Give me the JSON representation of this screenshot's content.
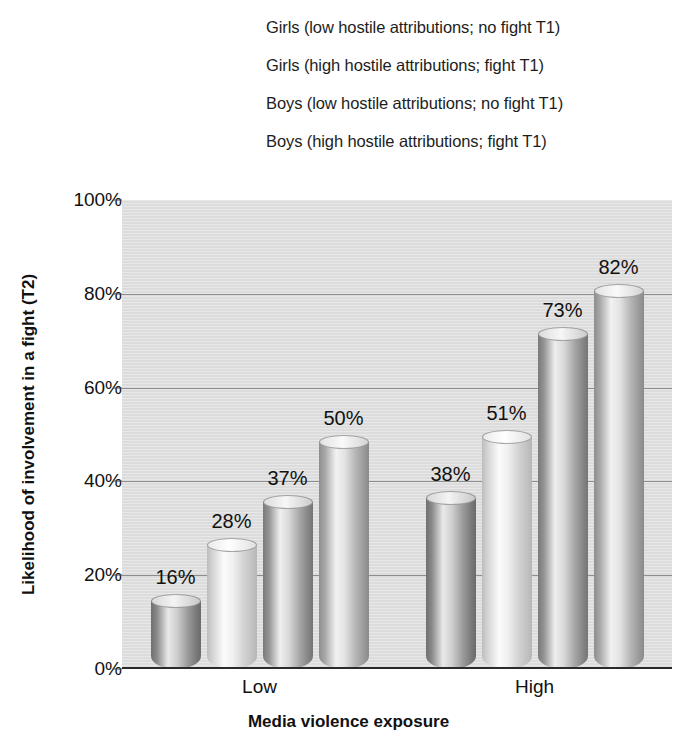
{
  "legend": {
    "position": "top",
    "items": [
      {
        "label": "Girls (low hostile attributions; no fight T1)",
        "shade": "shade-a",
        "swatch_icon": "cylinder-swatch-dark"
      },
      {
        "label": "Girls (high hostile attributions; fight T1)",
        "shade": "shade-b",
        "swatch_icon": "cylinder-swatch-light"
      },
      {
        "label": "Boys (low hostile attributions; no fight T1)",
        "shade": "shade-c",
        "swatch_icon": "cylinder-swatch-medium-dark"
      },
      {
        "label": "Boys (high hostile attributions; fight T1)",
        "shade": "shade-d",
        "swatch_icon": "cylinder-swatch-medium"
      }
    ]
  },
  "axes": {
    "y_title": "Likelihood of involvement in a fight (T2)",
    "x_title": "Media violence exposure",
    "y_ticks": [
      "0%",
      "20%",
      "40%",
      "60%",
      "80%",
      "100%"
    ]
  },
  "chart_data": {
    "type": "bar",
    "title": "",
    "subtitle": "",
    "xlabel": "Media violence exposure",
    "ylabel": "Likelihood of involvement in a fight (T2)",
    "categories": [
      "Low",
      "High"
    ],
    "ylim": [
      0,
      100
    ],
    "ytick_values": [
      0,
      20,
      40,
      60,
      80,
      100
    ],
    "ytick_labels": [
      "0%",
      "20%",
      "40%",
      "60%",
      "80%",
      "100%"
    ],
    "grid": true,
    "grid_axis": "y",
    "legend_position": "top",
    "value_suffix": "%",
    "series": [
      {
        "name": "Girls (low hostile attributions; no fight T1)",
        "values": [
          16,
          38
        ],
        "labels": [
          "16%",
          "38%"
        ],
        "color": "#7b7b7b"
      },
      {
        "name": "Girls (high hostile attributions; fight T1)",
        "values": [
          28,
          51
        ],
        "labels": [
          "28%",
          "51%"
        ],
        "color": "#d8d8d8"
      },
      {
        "name": "Boys (low hostile attributions; no fight T1)",
        "values": [
          37,
          73
        ],
        "labels": [
          "37%",
          "73%"
        ],
        "color": "#8a8a8a"
      },
      {
        "name": "Boys (high hostile attributions; fight T1)",
        "values": [
          50,
          82
        ],
        "labels": [
          "50%",
          "82%"
        ],
        "color": "#a3a3a3"
      }
    ],
    "plot_background": "#dcdcdc",
    "bar_style": "3d-cylinder"
  }
}
